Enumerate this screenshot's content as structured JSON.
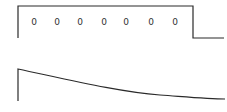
{
  "top_panel": {
    "labels": [
      "0",
      "0",
      "0",
      "0",
      "0",
      "0",
      "0"
    ],
    "label_x": [
      34,
      57,
      80,
      104,
      126,
      151,
      175
    ],
    "label_y": 17
  },
  "colors": {
    "stroke": "#2a2a2a",
    "label": "#333333",
    "background": "#ffffff"
  }
}
